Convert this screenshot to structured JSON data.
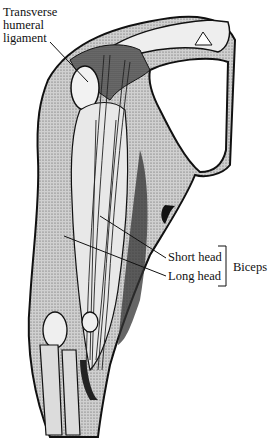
{
  "figure": {
    "labels": {
      "transverse_humeral_ligament": "Transverse humeral ligament",
      "short_head": "Short head",
      "long_head": "Long head",
      "group": "Biceps"
    },
    "colors": {
      "ink": "#111111",
      "shade": "#8a8a8a",
      "light_shade": "#c8c8c8",
      "paper": "#ffffff"
    }
  }
}
